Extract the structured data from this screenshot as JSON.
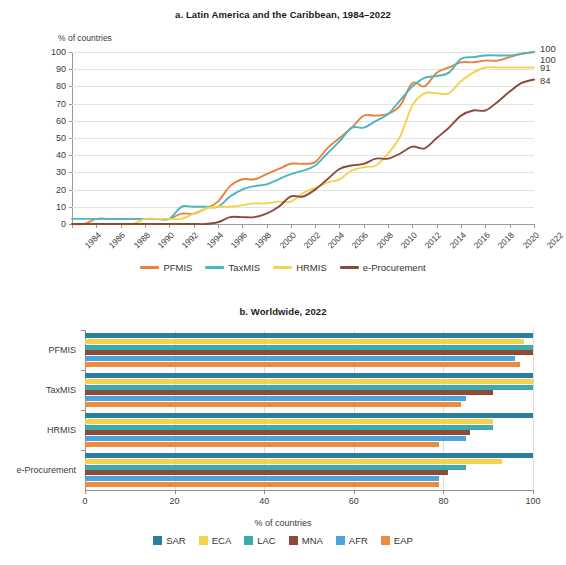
{
  "panel_a": {
    "title": "a. Latin America and the Caribbean, 1984–2022",
    "ylabel": "% of countries",
    "legend": [
      {
        "label": "PFMIS",
        "color": "#e8823c",
        "icon": "line-swatch"
      },
      {
        "label": "TaxMIS",
        "color": "#4cb5c3",
        "icon": "line-swatch"
      },
      {
        "label": "HRMIS",
        "color": "#f2d44d",
        "icon": "line-swatch"
      },
      {
        "label": "e-Procurement",
        "color": "#8c4a39",
        "icon": "line-swatch"
      }
    ],
    "end_labels": [
      {
        "value": "100",
        "series": "TaxMIS"
      },
      {
        "value": "100",
        "series": "PFMIS"
      },
      {
        "value": "91",
        "series": "HRMIS"
      },
      {
        "value": "84",
        "series": "e-Procurement"
      }
    ]
  },
  "panel_b": {
    "title": "b. Worldwide, 2022",
    "xlabel": "% of countries",
    "legend": [
      {
        "label": "SAR",
        "color": "#2b7f9e",
        "icon": "square-swatch"
      },
      {
        "label": "ECA",
        "color": "#f2d44d",
        "icon": "square-swatch"
      },
      {
        "label": "LAC",
        "color": "#3aada8",
        "icon": "square-swatch"
      },
      {
        "label": "MNA",
        "color": "#8c4a39",
        "icon": "square-swatch"
      },
      {
        "label": "AFR",
        "color": "#4aa3dc",
        "icon": "square-swatch"
      },
      {
        "label": "EAP",
        "color": "#ef8a3c",
        "icon": "square-swatch"
      }
    ]
  },
  "chart_data": [
    {
      "type": "line",
      "title": "a. Latin America and the Caribbean, 1984–2022",
      "xlabel": "",
      "ylabel": "% of countries",
      "ylim": [
        0,
        100
      ],
      "xlim": [
        1984,
        2022
      ],
      "yticks": [
        0,
        10,
        20,
        30,
        40,
        50,
        60,
        70,
        80,
        90,
        100
      ],
      "xticks": [
        1984,
        1986,
        1988,
        1990,
        1992,
        1994,
        1996,
        1998,
        2000,
        2002,
        2004,
        2006,
        2008,
        2010,
        2012,
        2014,
        2016,
        2018,
        2020,
        2022
      ],
      "grid": true,
      "legend_position": "bottom",
      "x": [
        1984,
        1985,
        1986,
        1987,
        1988,
        1989,
        1990,
        1991,
        1992,
        1993,
        1994,
        1995,
        1996,
        1997,
        1998,
        1999,
        2000,
        2001,
        2002,
        2003,
        2004,
        2005,
        2006,
        2007,
        2008,
        2009,
        2010,
        2011,
        2012,
        2013,
        2014,
        2015,
        2016,
        2017,
        2018,
        2019,
        2020,
        2021,
        2022
      ],
      "series": [
        {
          "name": "PFMIS",
          "color": "#e8823c",
          "end_label": "100",
          "values": [
            0,
            0,
            3,
            3,
            3,
            3,
            3,
            3,
            3,
            6,
            6,
            9,
            13,
            22,
            26,
            26,
            29,
            32,
            35,
            35,
            36,
            44,
            50,
            56,
            63,
            63,
            64,
            69,
            82,
            80,
            88,
            91,
            94,
            94,
            95,
            95,
            97,
            99,
            100
          ]
        },
        {
          "name": "TaxMIS",
          "color": "#4cb5c3",
          "end_label": "100",
          "values": [
            3,
            3,
            3,
            3,
            3,
            3,
            3,
            3,
            3,
            10,
            10,
            10,
            10,
            16,
            20,
            22,
            23,
            26,
            29,
            31,
            34,
            41,
            48,
            56,
            56,
            60,
            64,
            72,
            80,
            85,
            86,
            88,
            96,
            97,
            98,
            98,
            98,
            99,
            100
          ]
        },
        {
          "name": "HRMIS",
          "color": "#f2d44d",
          "end_label": "91",
          "values": [
            0,
            0,
            0,
            0,
            0,
            0,
            3,
            3,
            3,
            3,
            6,
            9,
            10,
            10,
            11,
            12,
            12,
            13,
            13,
            18,
            21,
            24,
            26,
            31,
            33,
            34,
            41,
            51,
            69,
            76,
            76,
            76,
            83,
            88,
            91,
            91,
            91,
            91,
            91
          ]
        },
        {
          "name": "e-Procurement",
          "color": "#8c4a39",
          "end_label": "84",
          "values": [
            0,
            0,
            0,
            0,
            0,
            0,
            0,
            0,
            0,
            0,
            0,
            0,
            1,
            4,
            4,
            4,
            6,
            10,
            16,
            16,
            20,
            26,
            32,
            34,
            35,
            38,
            38,
            41,
            45,
            44,
            50,
            56,
            63,
            66,
            66,
            71,
            77,
            82,
            84
          ]
        }
      ]
    },
    {
      "type": "bar",
      "orientation": "horizontal",
      "title": "b. Worldwide, 2022",
      "xlabel": "% of countries",
      "ylabel": "",
      "xlim": [
        0,
        100
      ],
      "xticks": [
        0,
        20,
        40,
        60,
        80,
        100
      ],
      "grid": true,
      "legend_position": "bottom",
      "categories": [
        "PFMIS",
        "TaxMIS",
        "HRMIS",
        "e-Procurement"
      ],
      "series": [
        {
          "name": "SAR",
          "color": "#2b7f9e",
          "values": [
            100,
            100,
            100,
            100
          ]
        },
        {
          "name": "ECA",
          "color": "#f2d44d",
          "values": [
            98,
            100,
            91,
            93
          ]
        },
        {
          "name": "LAC",
          "color": "#3aada8",
          "values": [
            100,
            100,
            91,
            85
          ]
        },
        {
          "name": "MNA",
          "color": "#8c4a39",
          "values": [
            100,
            91,
            86,
            81
          ]
        },
        {
          "name": "AFR",
          "color": "#4aa3dc",
          "values": [
            96,
            85,
            85,
            79
          ]
        },
        {
          "name": "EAP",
          "color": "#ef8a3c",
          "values": [
            97,
            84,
            79,
            79
          ]
        }
      ]
    }
  ]
}
